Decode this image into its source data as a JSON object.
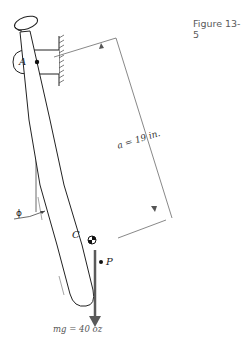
{
  "figure": {
    "label": "Figure 13-5"
  },
  "labels": {
    "pivot": "A",
    "center_of_mass": "C",
    "point_p": "P",
    "angle": "ϕ",
    "distance": "a = 19 in.",
    "weight": "mg = 40 oz"
  },
  "colors": {
    "line": "#222222",
    "dimension": "#555555",
    "force_arrow": "#5a5a5a",
    "text": "#333333"
  }
}
